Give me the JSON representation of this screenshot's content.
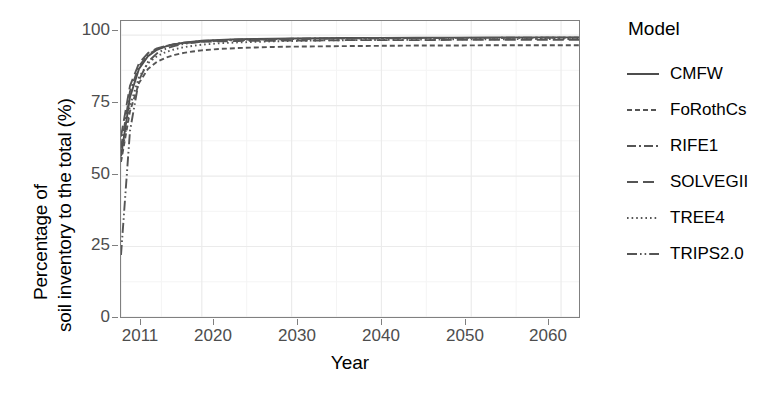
{
  "chart_data": {
    "type": "line",
    "title": "",
    "xlabel": "Year",
    "ylabel": "Percentage of soil inventory to the total (%)",
    "ylabel_line1": "Percentage of",
    "ylabel_line2": "soil inventory to the total (%)",
    "xlim": [
      2011,
      2062
    ],
    "ylim": [
      0,
      105
    ],
    "xticks": [
      2011,
      2020,
      2030,
      2040,
      2050,
      2060
    ],
    "yticks": [
      0,
      25,
      50,
      75,
      100
    ],
    "grid": true,
    "legend_position": "right",
    "legend_title": "Model",
    "x": [
      2011,
      2012,
      2013,
      2014,
      2015,
      2016,
      2017,
      2018,
      2019,
      2020,
      2022,
      2024,
      2026,
      2028,
      2030,
      2033,
      2036,
      2040,
      2044,
      2048,
      2052,
      2056,
      2060,
      2062
    ],
    "series": [
      {
        "name": "CMFW",
        "dash": "solid",
        "color": "#4d4d4d",
        "values": [
          57,
          78,
          88,
          92.5,
          94.8,
          96.0,
          96.8,
          97.3,
          97.7,
          98.0,
          98.3,
          98.5,
          98.6,
          98.7,
          98.8,
          98.9,
          99.0,
          99.0,
          99.1,
          99.1,
          99.2,
          99.2,
          99.2,
          99.2
        ]
      },
      {
        "name": "FoRothCs",
        "dash": "dashed-fine",
        "color": "#555555",
        "values": [
          55,
          73,
          83,
          88.0,
          90.5,
          92.0,
          93.0,
          93.7,
          94.2,
          94.6,
          95.1,
          95.4,
          95.6,
          95.8,
          95.9,
          96.0,
          96.1,
          96.2,
          96.3,
          96.3,
          96.4,
          96.4,
          96.4,
          96.4
        ]
      },
      {
        "name": "RIFE1",
        "dash": "dash-dot",
        "color": "#555555",
        "values": [
          60,
          80,
          89,
          93.0,
          95.0,
          96.1,
          96.8,
          97.3,
          97.6,
          97.9,
          98.2,
          98.4,
          98.5,
          98.6,
          98.7,
          98.8,
          98.9,
          98.9,
          99.0,
          99.0,
          99.0,
          99.1,
          99.1,
          99.1
        ]
      },
      {
        "name": "SOLVEGII",
        "dash": "long-dash",
        "color": "#555555",
        "values": [
          64,
          82,
          90,
          93.6,
          95.3,
          96.2,
          96.8,
          97.1,
          97.4,
          97.6,
          97.8,
          97.9,
          98.0,
          98.0,
          98.1,
          98.1,
          98.2,
          98.2,
          98.2,
          98.3,
          98.3,
          98.3,
          98.3,
          98.3
        ]
      },
      {
        "name": "TREE4",
        "dash": "dotted",
        "color": "#555555",
        "values": [
          56,
          75,
          85,
          90.0,
          92.5,
          94.0,
          95.0,
          95.7,
          96.2,
          96.6,
          97.1,
          97.4,
          97.6,
          97.8,
          97.9,
          98.1,
          98.2,
          98.3,
          98.4,
          98.5,
          98.5,
          98.6,
          98.6,
          98.6
        ]
      },
      {
        "name": "TRIPS2.0",
        "dash": "dash-dot-dot",
        "color": "#555555",
        "values": [
          22,
          66,
          84,
          90.5,
          93.5,
          95.2,
          96.2,
          96.9,
          97.3,
          97.7,
          98.0,
          98.2,
          98.4,
          98.5,
          98.6,
          98.7,
          98.8,
          98.9,
          98.9,
          99.0,
          99.0,
          99.0,
          99.1,
          99.1
        ]
      }
    ]
  },
  "legend": {
    "title": "Model",
    "items": [
      {
        "label": "CMFW",
        "key": "solid-line-key"
      },
      {
        "label": "FoRothCs",
        "key": "dashed-fine-line-key"
      },
      {
        "label": "RIFE1",
        "key": "dash-dot-line-key"
      },
      {
        "label": "SOLVEGII",
        "key": "long-dash-line-key"
      },
      {
        "label": "TREE4",
        "key": "dotted-line-key"
      },
      {
        "label": "TRIPS2.0",
        "key": "dash-dot-dot-line-key"
      }
    ]
  },
  "axes": {
    "x_title": "Year",
    "y_title_line1": "Percentage of",
    "y_title_line2": "soil inventory to the total (%)",
    "x_tick_labels": [
      "2011",
      "2020",
      "2030",
      "2040",
      "2050",
      "2060"
    ],
    "y_tick_labels": [
      "100",
      "75",
      "50",
      "25",
      "0"
    ]
  },
  "colors": {
    "line": "#555555",
    "primary_line": "#4d4d4d",
    "grid": "#ebebeb",
    "panel_border": "#808080",
    "tick_text": "#4d4d4d",
    "title_text": "#000000"
  }
}
